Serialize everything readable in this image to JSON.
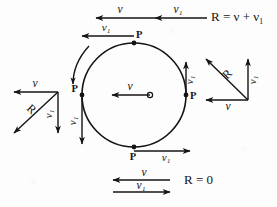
{
  "figure": {
    "background_color": "#fdfdfd",
    "ink_color": "#141414",
    "symbols": {
      "v": "ν",
      "v1": "ν₁",
      "R": "R",
      "P": "P"
    },
    "wheel": {
      "center_label": "o",
      "center_velocity_label": "ν",
      "contact_points_label": "P",
      "rotation_direction": "clockwise",
      "points": [
        {
          "name": "top",
          "label": "P",
          "vector_label": "ν₁",
          "direction": "left"
        },
        {
          "name": "left",
          "label": "P",
          "vector_label": "ν₁",
          "direction": "down"
        },
        {
          "name": "right",
          "label": "P",
          "vector_label": "ν₁",
          "direction": "up"
        },
        {
          "name": "bottom",
          "label": "P",
          "vector_label": "ν₁",
          "direction": "right"
        }
      ]
    },
    "top_annotation": {
      "vector_a_label": "ν",
      "vector_b_label": "ν₁",
      "result_text": "R = ν + ν₁",
      "direction_a": "left",
      "direction_b": "left"
    },
    "bottom_annotation": {
      "vector_a_label": "ν",
      "vector_b_label": "ν₁",
      "result_text": "R = 0",
      "direction_a": "left",
      "direction_b": "right"
    },
    "left_triangle": {
      "horizontal_label": "ν",
      "vertical_label": "ν₁",
      "resultant_label": "R",
      "horizontal_direction": "left",
      "vertical_direction": "down",
      "resultant_direction": "down-left"
    },
    "right_triangle": {
      "horizontal_label": "ν",
      "vertical_label": "ν₁",
      "resultant_label": "R",
      "horizontal_direction": "left",
      "vertical_direction": "up",
      "resultant_direction": "up-left"
    }
  }
}
